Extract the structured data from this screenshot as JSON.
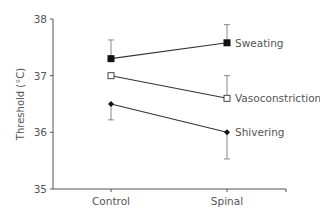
{
  "chart_data": {
    "type": "line",
    "title": "",
    "xlabel": "",
    "ylabel": "Threshold (°C)",
    "categories": [
      "Control",
      "Spinal"
    ],
    "ylim": [
      35,
      38
    ],
    "yticks": [
      "35",
      "36",
      "37",
      "38"
    ],
    "grid": false,
    "legend_position": "inline-right",
    "series": [
      {
        "name": "Sweating",
        "marker": "filled-square",
        "values": [
          37.3,
          37.58
        ],
        "error_upper": [
          37.63,
          37.9
        ]
      },
      {
        "name": "Vasoconstriction",
        "marker": "open-square",
        "values": [
          37.0,
          36.6
        ],
        "error_upper": [
          null,
          37.0
        ]
      },
      {
        "name": "Shivering",
        "marker": "filled-diamond",
        "values": [
          36.5,
          36.0
        ],
        "error_lower": [
          36.22,
          35.53
        ]
      }
    ]
  },
  "colors": {
    "line": "#333333",
    "axis": "#555555",
    "text": "#555555",
    "errorbar": "#888888"
  }
}
